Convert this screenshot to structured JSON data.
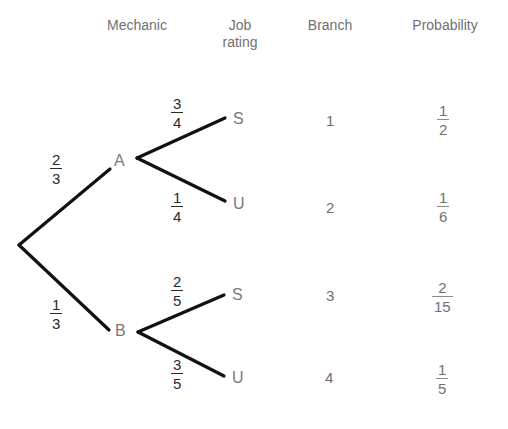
{
  "headers": {
    "mechanic": "Mechanic",
    "job_rating_line1": "Job",
    "job_rating_line2": "rating",
    "branch": "Branch",
    "probability": "Probability"
  },
  "tree": {
    "first_level": [
      {
        "node": "A",
        "prob_num": "2",
        "prob_den": "3"
      },
      {
        "node": "B",
        "prob_num": "1",
        "prob_den": "3"
      }
    ],
    "second_level": [
      {
        "parent": "A",
        "node": "S",
        "prob_num": "3",
        "prob_den": "4"
      },
      {
        "parent": "A",
        "node": "U",
        "prob_num": "1",
        "prob_den": "4"
      },
      {
        "parent": "B",
        "node": "S",
        "prob_num": "2",
        "prob_den": "5"
      },
      {
        "parent": "B",
        "node": "U",
        "prob_num": "3",
        "prob_den": "5"
      }
    ]
  },
  "branches": [
    {
      "branch": "1",
      "prob_num": "1",
      "prob_den": "2"
    },
    {
      "branch": "2",
      "prob_num": "1",
      "prob_den": "6"
    },
    {
      "branch": "3",
      "prob_num": "2",
      "prob_den": "15"
    },
    {
      "branch": "4",
      "prob_num": "1",
      "prob_den": "5"
    }
  ],
  "colors": {
    "lines": "#111111",
    "label_text": "#707070",
    "fraction_text": "#2a2a2a"
  }
}
